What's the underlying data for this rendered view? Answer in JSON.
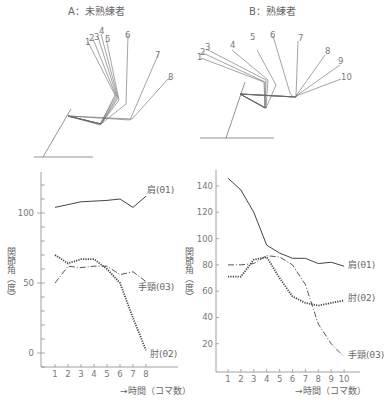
{
  "figures": {
    "A": {
      "title": "A：未熟練者",
      "frame_labels": [
        "1",
        "2",
        "3",
        "4",
        "5",
        "6",
        "7",
        "8"
      ]
    },
    "B": {
      "title": "B：熟練者",
      "frame_labels": [
        "1",
        "2",
        "3",
        "4",
        "5",
        "6",
        "7",
        "8",
        "9",
        "10"
      ]
    }
  },
  "chart_data": [
    {
      "type": "line",
      "panel": "A",
      "title": "A：未熟練者",
      "xlabel": "→時間（コマ数）",
      "ylabel": "関節角（度）",
      "x": [
        1,
        2,
        3,
        4,
        5,
        6,
        7,
        8
      ],
      "xticks": [
        "1",
        "2",
        "3",
        "4",
        "5",
        "6",
        "7",
        "8"
      ],
      "ylim": [
        -8,
        125
      ],
      "yticks": [
        0,
        50,
        100
      ],
      "ytick_labels": [
        "0",
        "50",
        "100"
      ],
      "yminor_step": 10,
      "grid": false,
      "series": [
        {
          "name": "肩(θ1)",
          "style": "solid",
          "values": [
            104,
            106,
            108,
            108.5,
            109,
            110,
            104,
            112
          ]
        },
        {
          "name": "肘(θ2)",
          "style": "dotted",
          "values": [
            70,
            64,
            67,
            67,
            60,
            50,
            25,
            2
          ]
        },
        {
          "name": "手頸(θ3)",
          "style": "dashdot",
          "values": [
            50,
            62,
            61,
            62,
            62,
            56,
            58,
            51
          ]
        }
      ],
      "legend_labels": {
        "shoulder": "肩(θ1)",
        "elbow": "肘(θ2)",
        "wrist": "手頸(θ3)"
      }
    },
    {
      "type": "line",
      "panel": "B",
      "title": "B：熟練者",
      "xlabel": "→時間（コマ数）",
      "ylabel": "関節角（度）",
      "x": [
        1,
        2,
        3,
        4,
        5,
        6,
        7,
        8,
        9,
        10
      ],
      "xticks": [
        "1",
        "2",
        "3",
        "4",
        "5",
        "6",
        "7",
        "8",
        "9",
        "10"
      ],
      "ylim": [
        0,
        150
      ],
      "yticks": [
        20,
        40,
        60,
        80,
        100,
        120,
        140
      ],
      "ytick_labels": [
        "20",
        "40",
        "60",
        "80",
        "100",
        "120",
        "140"
      ],
      "grid": false,
      "series": [
        {
          "name": "肩(θ1)",
          "style": "solid",
          "values": [
            146,
            137,
            120,
            95,
            89,
            85,
            85,
            81,
            82,
            79
          ]
        },
        {
          "name": "肘(θ2)",
          "style": "dotted",
          "values": [
            71,
            71,
            84,
            86,
            70,
            56,
            51,
            49,
            51,
            53
          ]
        },
        {
          "name": "手頸(θ3)",
          "style": "dashdot",
          "values": [
            80,
            80,
            81,
            87,
            86,
            80,
            65,
            35,
            20,
            10
          ]
        }
      ],
      "legend_labels": {
        "shoulder": "肩(θ1)",
        "elbow": "肘(θ2)",
        "wrist": "手頸(θ3)"
      }
    }
  ]
}
